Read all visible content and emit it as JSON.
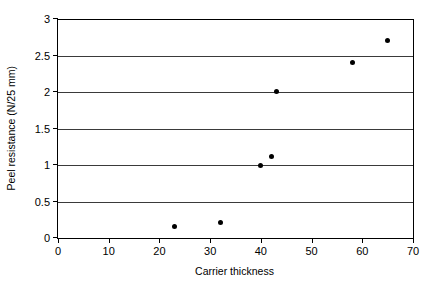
{
  "chart_data": {
    "type": "scatter",
    "title": "",
    "xlabel": "Carrier thickness",
    "ylabel": "Peel resistance (N/25 mm)",
    "xlim": [
      0,
      70
    ],
    "ylim": [
      0,
      3
    ],
    "xticks": [
      0,
      10,
      20,
      30,
      40,
      50,
      60,
      70
    ],
    "yticks": [
      0,
      0.5,
      1,
      1.5,
      2,
      2.5,
      3
    ],
    "xtick_labels": [
      "0",
      "10",
      "20",
      "30",
      "40",
      "50",
      "60",
      "70"
    ],
    "ytick_labels": [
      "0",
      "0.5",
      "1",
      "1.5",
      "2",
      "2.5",
      "3"
    ],
    "grid": "horizontal",
    "legend": "none",
    "marker": "filled-circle",
    "marker_color": "#000000",
    "points": [
      {
        "x": 23,
        "y": 0.16
      },
      {
        "x": 32,
        "y": 0.21
      },
      {
        "x": 40,
        "y": 1.0
      },
      {
        "x": 42,
        "y": 1.11
      },
      {
        "x": 43,
        "y": 2.01
      },
      {
        "x": 58,
        "y": 2.41
      },
      {
        "x": 65,
        "y": 2.71
      }
    ]
  }
}
